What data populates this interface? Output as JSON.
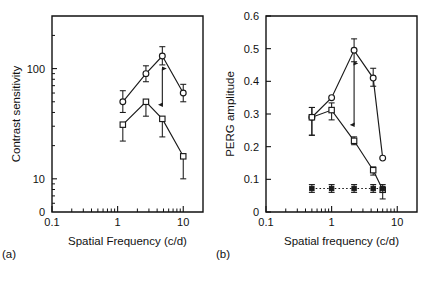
{
  "figure": {
    "background": "#ffffff",
    "ink": "#1a1a1a"
  },
  "panels": [
    {
      "key": "a",
      "label": "(a)",
      "xlabel": "Spatial Frequency (c/d)",
      "ylabel": "Contrast sensitivity"
    },
    {
      "key": "b",
      "label": "(b)",
      "xlabel": "Spatial frequency (c/d)",
      "ylabel": "PERG amplitude"
    }
  ],
  "chart_data": [
    {
      "type": "line",
      "panel": "(a)",
      "title": "",
      "xlabel": "Spatial Frequency (c/d)",
      "ylabel": "Contrast sensitivity",
      "xscale": "log",
      "yscale": "log",
      "xlim": [
        0.1,
        20
      ],
      "ylim": [
        5,
        300
      ],
      "xticks": [
        0.1,
        1,
        10
      ],
      "xticklabels": [
        "0.1",
        "1",
        "10"
      ],
      "yticks": [
        10,
        100
      ],
      "yticklabels": [
        "10",
        "100"
      ],
      "origin_label": "0",
      "grid": false,
      "legend": "none",
      "series": [
        {
          "name": "upper-curve-circles",
          "marker": "open-circle",
          "linestyle": "solid",
          "x": [
            1.2,
            2.7,
            4.8,
            10.0
          ],
          "y": [
            50,
            90,
            130,
            60
          ],
          "yerr_low": [
            10,
            14,
            22,
            10
          ],
          "yerr_high": [
            13,
            16,
            28,
            12
          ]
        },
        {
          "name": "lower-curve-squares",
          "marker": "open-square",
          "linestyle": "solid",
          "x": [
            1.2,
            2.7,
            4.8,
            10.0
          ],
          "y": [
            31,
            50,
            35,
            16
          ],
          "yerr_low": [
            9,
            13,
            11,
            6
          ],
          "yerr_high": [
            0,
            0,
            0,
            0
          ]
        }
      ],
      "annotations": [
        {
          "name": "double-headed-arrow",
          "type": "arrow",
          "x": 4.8,
          "y_from": 100,
          "y_to": 47,
          "double_headed": true
        }
      ]
    },
    {
      "type": "line",
      "panel": "(b)",
      "title": "",
      "xlabel": "Spatial frequency (c/d)",
      "ylabel": "PERG amplitude",
      "xscale": "log",
      "yscale": "linear",
      "xlim": [
        0.1,
        20
      ],
      "ylim": [
        0,
        0.6
      ],
      "xticks": [
        0.1,
        1,
        10
      ],
      "xticklabels": [
        "0.1",
        "1",
        "10"
      ],
      "yticks": [
        0,
        0.1,
        0.2,
        0.3,
        0.4,
        0.5,
        0.6
      ],
      "yticklabels": [
        "0",
        "0.1",
        "0.2",
        "0.3",
        "0.4",
        "0.5",
        "0.6"
      ],
      "grid": false,
      "legend": "none",
      "series": [
        {
          "name": "upper-curve-circles",
          "marker": "open-circle",
          "linestyle": "solid",
          "x": [
            0.5,
            1.0,
            2.2,
            4.3,
            6.0
          ],
          "y": [
            0.29,
            0.35,
            0.495,
            0.41,
            0.165
          ],
          "yerr_low": [
            0.055,
            0.0,
            0.035,
            0.025,
            0.0
          ],
          "yerr_high": [
            0.03,
            0.0,
            0.035,
            0.03,
            0.0
          ]
        },
        {
          "name": "lower-curve-squares",
          "marker": "open-square",
          "linestyle": "solid",
          "x": [
            0.5,
            1.0,
            2.2,
            4.3,
            6.0
          ],
          "y": [
            0.29,
            0.312,
            0.218,
            0.128,
            0.068
          ],
          "yerr_low": [
            0.055,
            0.03,
            0.012,
            0.015,
            0.028
          ],
          "yerr_high": [
            0.03,
            0.022,
            0.012,
            0.01,
            0.0
          ]
        },
        {
          "name": "noise-floor-filled-squares",
          "marker": "filled-square",
          "linestyle": "dotted",
          "x": [
            0.5,
            1.0,
            2.2,
            4.3,
            6.0
          ],
          "y": [
            0.072,
            0.072,
            0.072,
            0.072,
            0.072
          ],
          "yerr_low": [
            0.012,
            0.012,
            0.012,
            0.012,
            0.012
          ],
          "yerr_high": [
            0.012,
            0.012,
            0.012,
            0.012,
            0.012
          ]
        }
      ],
      "annotations": [
        {
          "name": "double-headed-arrow",
          "type": "arrow",
          "x": 2.2,
          "y_from": 0.455,
          "y_to": 0.267,
          "double_headed": true
        }
      ]
    }
  ]
}
